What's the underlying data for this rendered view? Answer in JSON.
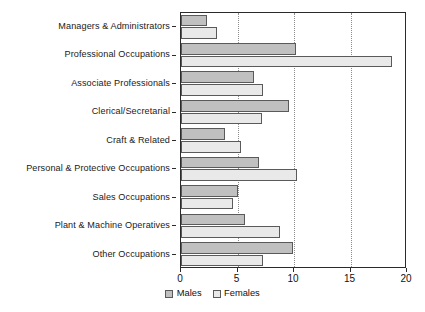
{
  "chart_data": {
    "type": "bar",
    "orientation": "horizontal",
    "title": "",
    "subtitle": "",
    "xlabel": "",
    "ylabel": "",
    "xlim": [
      0,
      20
    ],
    "xticks": [
      0,
      5,
      10,
      15,
      20
    ],
    "xtick_labels": [
      "0",
      "5",
      "10",
      "15",
      "20"
    ],
    "grid": "vertical-dotted-at-5-10-15",
    "legend_position": "bottom-center",
    "categories": [
      "Managers & Administrators",
      "Professional Occupations",
      "Associate Professionals",
      "Clerical/Secretarial",
      "Craft & Related",
      "Personal & Protective Occupations",
      "Sales Occupations",
      "Plant & Machine Operatives",
      "Other Occupations"
    ],
    "series": [
      {
        "name": "Males",
        "color": "#c0c0c0",
        "values": [
          2.3,
          10.2,
          6.5,
          9.6,
          3.9,
          6.9,
          5.0,
          5.7,
          9.9
        ]
      },
      {
        "name": "Females",
        "color": "#e9e9e9",
        "values": [
          3.2,
          18.7,
          7.3,
          7.2,
          5.3,
          10.3,
          4.6,
          8.8,
          7.3
        ]
      }
    ]
  }
}
